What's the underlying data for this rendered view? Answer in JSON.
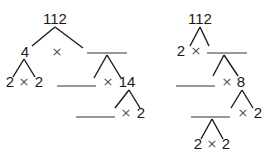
{
  "colors": {
    "ink": "#1a1a1a",
    "times_sign": "#555555",
    "background": "#ffffff"
  },
  "left_tree": {
    "root": "112",
    "level1": {
      "left": "4",
      "op": "×",
      "right_blank": ""
    },
    "level2_left": {
      "left": "2",
      "op": "×",
      "right": "2"
    },
    "level2_right": {
      "left_blank": "",
      "op": "×",
      "right": "14"
    },
    "level3": {
      "left_blank": "",
      "op": "×",
      "right": "2"
    }
  },
  "right_tree": {
    "root": "112",
    "level1": {
      "left": "2",
      "op": "×",
      "right_blank": ""
    },
    "level2": {
      "left_blank": "",
      "op": "×",
      "right": "8"
    },
    "level3": {
      "left_blank": "",
      "op": "×",
      "right": "2"
    },
    "level4": {
      "left": "2",
      "op": "×",
      "right": "2"
    }
  }
}
